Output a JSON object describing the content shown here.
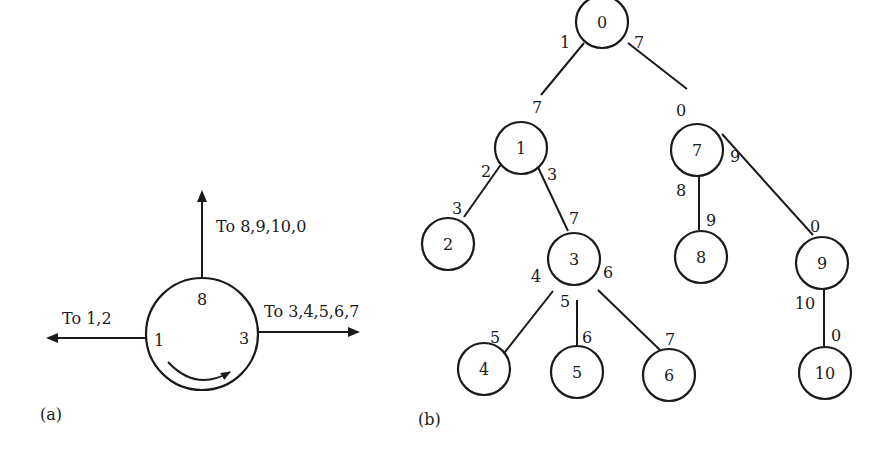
{
  "panel_a": {
    "label": "(a)",
    "node": {
      "ports": {
        "top": "8",
        "left": "1",
        "right": "3"
      }
    },
    "arrows": {
      "up": "To  8,9,10,0",
      "left": "To  1,2",
      "right": "To  3,4,5,6,7"
    },
    "rotation": "clockwise"
  },
  "panel_b": {
    "label": "(b)",
    "nodes": [
      {
        "id": "0",
        "label": "0"
      },
      {
        "id": "1",
        "label": "1"
      },
      {
        "id": "7",
        "label": "7"
      },
      {
        "id": "2",
        "label": "2"
      },
      {
        "id": "3",
        "label": "3"
      },
      {
        "id": "8",
        "label": "8"
      },
      {
        "id": "9",
        "label": "9"
      },
      {
        "id": "4",
        "label": "4"
      },
      {
        "id": "5",
        "label": "5"
      },
      {
        "id": "6",
        "label": "6"
      },
      {
        "id": "10",
        "label": "10"
      }
    ],
    "edges": [
      {
        "from": "0",
        "to": "1",
        "from_label": "1",
        "to_label": "7"
      },
      {
        "from": "0",
        "to": "7",
        "from_label": "7",
        "to_label": "0"
      },
      {
        "from": "1",
        "to": "2",
        "from_label": "2",
        "to_label": "3"
      },
      {
        "from": "1",
        "to": "3",
        "from_label": "3",
        "to_label": "7"
      },
      {
        "from": "7",
        "to": "8",
        "from_label": "8",
        "to_label": "9"
      },
      {
        "from": "7",
        "to": "9",
        "from_label": "9",
        "to_label": "0"
      },
      {
        "from": "3",
        "to": "4",
        "from_label": "4",
        "to_label": "5"
      },
      {
        "from": "3",
        "to": "5",
        "from_label": "5",
        "to_label": "6"
      },
      {
        "from": "3",
        "to": "6",
        "from_label": "6",
        "to_label": "7"
      },
      {
        "from": "9",
        "to": "10",
        "from_label": "10",
        "to_label": "0"
      }
    ]
  }
}
